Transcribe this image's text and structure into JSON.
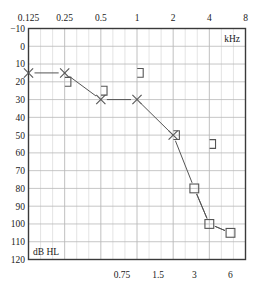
{
  "chart_data": {
    "type": "line",
    "title": "",
    "xlabel": "kHz",
    "ylabel": "dB HL",
    "x_axis_unit_label": "kHz",
    "y_axis_unit_label": "dB HL",
    "x_scale": "log2",
    "xlim": [
      0.125,
      8
    ],
    "ylim": [
      -10,
      120
    ],
    "y_invert": true,
    "grid": true,
    "legend_position": "none",
    "x_ticks_top": [
      "0.125",
      "0.25",
      "0.5",
      "1",
      "2",
      "4",
      "8"
    ],
    "x_tick_values_top": [
      0.125,
      0.25,
      0.5,
      1,
      2,
      4,
      8
    ],
    "x_ticks_bottom": [
      "0.75",
      "1.5",
      "3",
      "6"
    ],
    "x_tick_values_bottom": [
      0.75,
      1.5,
      3,
      6
    ],
    "y_ticks": [
      "-10",
      "0",
      "10",
      "20",
      "30",
      "40",
      "50",
      "60",
      "70",
      "80",
      "90",
      "100",
      "110",
      "120"
    ],
    "y_tick_values": [
      -10,
      0,
      10,
      20,
      30,
      40,
      50,
      60,
      70,
      80,
      90,
      100,
      110,
      120
    ],
    "series": [
      {
        "name": "air-conduction-left",
        "marker": "x",
        "connected": true,
        "color": "#555555",
        "points": [
          {
            "x": 0.125,
            "y": 15
          },
          {
            "x": 0.25,
            "y": 15
          },
          {
            "x": 0.5,
            "y": 30
          },
          {
            "x": 1,
            "y": 30
          },
          {
            "x": 2,
            "y": 50
          },
          {
            "x": 3,
            "y": 80
          },
          {
            "x": 4,
            "y": 100
          },
          {
            "x": 6,
            "y": 105
          }
        ]
      },
      {
        "name": "air-conduction-left-no-response",
        "marker": "square",
        "connected": true,
        "color": "#555555",
        "points": [
          {
            "x": 3,
            "y": 80
          },
          {
            "x": 4,
            "y": 100
          },
          {
            "x": 6,
            "y": 105
          }
        ]
      },
      {
        "name": "bone-conduction-left-unmasked",
        "marker": "bracket-right",
        "connected": false,
        "color": "#555555",
        "points": [
          {
            "x": 0.25,
            "y": 20
          },
          {
            "x": 0.5,
            "y": 25
          },
          {
            "x": 1,
            "y": 15
          },
          {
            "x": 2,
            "y": 50
          },
          {
            "x": 4,
            "y": 55
          }
        ]
      }
    ],
    "colors": {
      "axis": "#3a3a3a",
      "grid_major": "#b9b9b9",
      "grid_minor": "#d9d9d9",
      "marker": "#555555",
      "text": "#1a1a1a",
      "background": "#ffffff"
    }
  }
}
